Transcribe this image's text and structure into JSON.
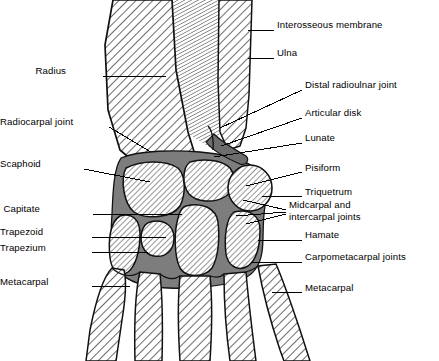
{
  "figure": {
    "colors": {
      "bone_fill": "#ffffff",
      "hatch_line": "#3a3a3a",
      "joint_space": "#7d7d7d",
      "outline": "#111111",
      "membrane": "#555555",
      "leader": "#000000",
      "text": "#000000",
      "background": "#ffffff"
    }
  },
  "labels_right": [
    {
      "id": "interosseous-membrane",
      "text": "Interosseous membrane",
      "x": 277,
      "y": 25,
      "leaders": [
        [
          274,
          30,
          248,
          30
        ]
      ]
    },
    {
      "id": "ulna",
      "text": "Ulna",
      "x": 277,
      "y": 53,
      "leaders": [
        [
          274,
          58,
          248,
          58
        ]
      ]
    },
    {
      "id": "distal-radioulnar-joint",
      "text": "Distal radioulnar joint",
      "x": 305,
      "y": 85,
      "leaders": [
        [
          302,
          90,
          220,
          128
        ]
      ]
    },
    {
      "id": "articular-disk",
      "text": "Articular disk",
      "x": 305,
      "y": 113,
      "leaders": [
        [
          302,
          118,
          221,
          146
        ]
      ]
    },
    {
      "id": "lunate",
      "text": "Lunate",
      "x": 305,
      "y": 138,
      "leaders": [
        [
          302,
          143,
          214,
          157
        ]
      ]
    },
    {
      "id": "pisiform",
      "text": "Pisiform",
      "x": 305,
      "y": 168,
      "leaders": [
        [
          302,
          172,
          246,
          186
        ]
      ]
    },
    {
      "id": "triquetrum",
      "text": "Triquetrum",
      "x": 305,
      "y": 192,
      "leaders": [
        [
          302,
          196,
          262,
          196
        ]
      ]
    },
    {
      "id": "midcarpal-and-intercarpal-joints",
      "text": "Midcarpal and\nintercarpal joints",
      "x": 289,
      "y": 205,
      "leaders": [
        [
          286,
          210,
          243,
          200
        ],
        [
          286,
          212,
          236,
          216
        ],
        [
          286,
          214,
          246,
          224
        ]
      ]
    },
    {
      "id": "hamate",
      "text": "Hamate",
      "x": 305,
      "y": 235,
      "leaders": [
        [
          302,
          240,
          258,
          240
        ]
      ]
    },
    {
      "id": "carpometacarpal-joints",
      "text": "Carpometacarpal joints",
      "x": 305,
      "y": 257,
      "leaders": [
        [
          302,
          262,
          252,
          262
        ]
      ]
    },
    {
      "id": "metacarpal-right",
      "text": "Metacarpal",
      "x": 305,
      "y": 288,
      "leaders": [
        [
          302,
          292,
          272,
          292
        ]
      ]
    }
  ],
  "labels_left": [
    {
      "id": "radius",
      "text": "Radius",
      "x": 66,
      "y": 71,
      "leaders": [
        [
          103,
          76,
          166,
          76
        ]
      ]
    },
    {
      "id": "radiocarpal-joint",
      "text": "Radiocarpal joint",
      "x": 18,
      "y": 122,
      "leaders": [
        [
          109,
          127,
          151,
          152
        ]
      ]
    },
    {
      "id": "scaphoid",
      "text": "Scaphoid",
      "x": 28,
      "y": 164,
      "leaders": [
        [
          84,
          169,
          150,
          182
        ]
      ]
    },
    {
      "id": "capitate",
      "text": "Capitate",
      "x": 40,
      "y": 209,
      "leaders": [
        [
          93,
          214,
          182,
          214
        ]
      ]
    },
    {
      "id": "trapezoid",
      "text": "Trapezoid",
      "x": 34,
      "y": 232,
      "leaders": [
        [
          92,
          237,
          166,
          237
        ]
      ]
    },
    {
      "id": "trapezium",
      "text": "Trapezium",
      "x": 31,
      "y": 248,
      "leaders": [
        [
          92,
          252,
          148,
          252
        ]
      ]
    },
    {
      "id": "metacarpal-left",
      "text": "Metacarpal",
      "x": 27,
      "y": 282,
      "leaders": [
        [
          92,
          286,
          130,
          286
        ]
      ]
    }
  ],
  "structures": [
    {
      "id": "radius-bone",
      "name": "Radius"
    },
    {
      "id": "ulna-bone",
      "name": "Ulna"
    },
    {
      "id": "interosseous-membrane-shape",
      "name": "Interosseous membrane"
    },
    {
      "id": "articular-disk-shape",
      "name": "Articular disk"
    },
    {
      "id": "scaphoid-bone",
      "name": "Scaphoid"
    },
    {
      "id": "lunate-bone",
      "name": "Lunate"
    },
    {
      "id": "triquetrum-bone",
      "name": "Triquetrum"
    },
    {
      "id": "pisiform-bone",
      "name": "Pisiform"
    },
    {
      "id": "capitate-bone",
      "name": "Capitate"
    },
    {
      "id": "hamate-bone",
      "name": "Hamate"
    },
    {
      "id": "trapezium-bone",
      "name": "Trapezium"
    },
    {
      "id": "trapezoid-bone",
      "name": "Trapezoid"
    },
    {
      "id": "metacarpal-1",
      "name": "First metacarpal"
    },
    {
      "id": "metacarpal-2",
      "name": "Second metacarpal"
    },
    {
      "id": "metacarpal-3",
      "name": "Third metacarpal"
    },
    {
      "id": "metacarpal-4",
      "name": "Fourth metacarpal"
    },
    {
      "id": "metacarpal-5",
      "name": "Fifth metacarpal"
    }
  ]
}
